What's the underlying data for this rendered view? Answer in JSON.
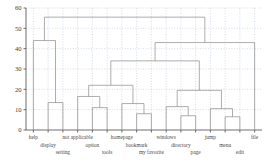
{
  "chart_data": {
    "type": "dendrogram",
    "title": "",
    "xlabel": "",
    "ylabel": "",
    "ylim": [
      0,
      60
    ],
    "yticks": [
      0,
      10,
      20,
      30,
      40,
      50,
      60
    ],
    "ytick_labels": [
      "0",
      "10",
      "20",
      "30",
      "40",
      "50",
      "60"
    ],
    "grid": true,
    "grid_style": "dotted",
    "leaf_order": [
      "help",
      "display",
      "setting",
      "not applicable",
      "option",
      "tools",
      "homepage",
      "bookmark",
      "my favorite",
      "windows",
      "directory",
      "page",
      "jump",
      "menu",
      "edit",
      "file"
    ],
    "leaf_label_rows": [
      0,
      1,
      2,
      0,
      1,
      2,
      0,
      1,
      2,
      0,
      1,
      2,
      0,
      1,
      2,
      0
    ],
    "merges": [
      {
        "id": "m1",
        "left": "display",
        "right": "setting",
        "height": 13.5
      },
      {
        "id": "m2",
        "left": "help",
        "right": "m1",
        "height": 44.0
      },
      {
        "id": "m3",
        "left": "option",
        "right": "tools",
        "height": 11.0
      },
      {
        "id": "m4",
        "left": "not applicable",
        "right": "m3",
        "height": 16.5
      },
      {
        "id": "m5",
        "left": "bookmark",
        "right": "my favorite",
        "height": 8.0
      },
      {
        "id": "m6",
        "left": "homepage",
        "right": "m5",
        "height": 13.0
      },
      {
        "id": "m7",
        "left": "m4",
        "right": "m6",
        "height": 22.0
      },
      {
        "id": "m8",
        "left": "directory",
        "right": "page",
        "height": 7.0
      },
      {
        "id": "m9",
        "left": "windows",
        "right": "m8",
        "height": 11.5
      },
      {
        "id": "m10",
        "left": "menu",
        "right": "edit",
        "height": 6.5
      },
      {
        "id": "m11",
        "left": "jump",
        "right": "m10",
        "height": 10.5
      },
      {
        "id": "m12",
        "left": "m9",
        "right": "m11",
        "height": 19.5
      },
      {
        "id": "m13",
        "left": "m7",
        "right": "m12",
        "height": 34.0
      },
      {
        "id": "m14",
        "left": "m13",
        "right": "file",
        "height": 43.0
      },
      {
        "id": "m15",
        "left": "m2",
        "right": "m14",
        "height": 55.5
      }
    ],
    "line_color": "#8a8a8a",
    "axis_color": "#4a4a4a",
    "grid_color": "#b9c4d6"
  }
}
